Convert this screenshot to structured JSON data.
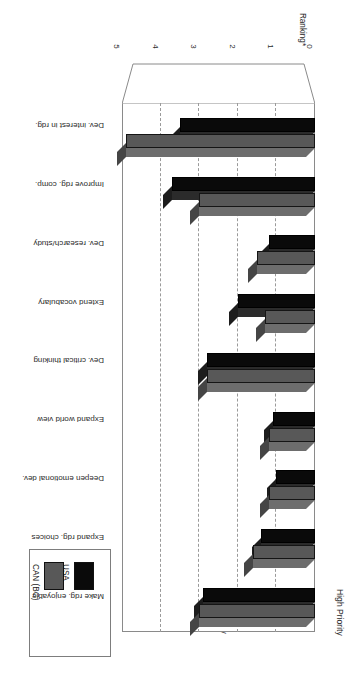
{
  "figure": {
    "number": "Figure 11.1:",
    "caption": "Reading aims — USA vs BC: High level (Pop. A)"
  },
  "legend": {
    "items": [
      {
        "label": "USA",
        "color": "#0a0a0a"
      },
      {
        "label": "CAN (BC)",
        "color": "#585858"
      }
    ]
  },
  "annotations": {
    "high_priority": "High Priority",
    "low_priority": "Low Priority"
  },
  "axis": {
    "title": "Ranking*",
    "ticks": [
      "0",
      "1",
      "2",
      "3",
      "4",
      "5"
    ]
  },
  "chart_data": {
    "type": "bar",
    "orientation": "horizontal",
    "title": "Reading aims — USA vs BC: High level (Pop. A)",
    "xlabel": "Ranking*",
    "ylabel": "",
    "xlim": [
      0,
      5
    ],
    "grid": true,
    "legend_position": "top-right",
    "categories": [
      "Dev. interest in rdg.",
      "Improve rdg. comp.",
      "Dev. research/study",
      "Extend vocabulary",
      "Dev. critical thinking",
      "Expand world view",
      "Deepen emotional dev.",
      "Expand rdg. choices",
      "Make rdg. enjoyable"
    ],
    "series": [
      {
        "name": "USA",
        "color": "#0a0a0a",
        "values": [
          3.5,
          3.7,
          1.2,
          2.0,
          2.8,
          1.1,
          1.0,
          1.4,
          2.9
        ]
      },
      {
        "name": "CAN (BC)",
        "color": "#585858",
        "values": [
          4.9,
          3.0,
          1.5,
          1.3,
          2.8,
          1.2,
          1.2,
          1.6,
          3.0
        ]
      }
    ],
    "annotations": [
      {
        "text": "High Priority",
        "near_value": 5
      },
      {
        "text": "Low Priority",
        "near_value": 1.6
      }
    ]
  }
}
